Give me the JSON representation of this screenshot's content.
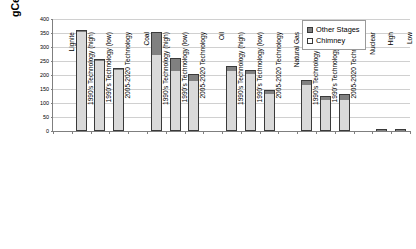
{
  "chart_data": {
    "type": "bar",
    "title": "",
    "subtitle": "",
    "xlabel": "",
    "ylabel": "gCeq/kWh",
    "ylim": [
      0,
      400
    ],
    "yticks": [
      0,
      50,
      100,
      150,
      200,
      250,
      300,
      350,
      400
    ],
    "grid": true,
    "stacked": true,
    "legend_position": "top-right",
    "legend": [
      "Other Stages",
      "Chimney"
    ],
    "categories": [
      "Lignite",
      "1990's Technology (high)",
      "1990's Technology (low)",
      "2005-2020 Technology",
      "Coal",
      "1990's Technology (high)",
      "1990's Technology (low)",
      "2005-2020 Technology",
      "Oil",
      "1990's Technology (high)",
      "1990's Technology (low)",
      "2005-2020 Technology",
      "Natural Gas",
      "1990's Technology (high)",
      "1990's Technology (low)",
      "2005-2020 Technology",
      "Nuclear",
      "High",
      "Low"
    ],
    "series": [
      {
        "name": "Chimney",
        "color": "#d9d9d9",
        "values": [
          null,
          352,
          251,
          219,
          null,
          273,
          213,
          178,
          null,
          215,
          205,
          133,
          null,
          163,
          110,
          112,
          null,
          0,
          0
        ]
      },
      {
        "name": "Other Stages",
        "color": "#808080",
        "values": [
          null,
          10,
          8,
          7,
          null,
          82,
          49,
          25,
          null,
          17,
          13,
          15,
          null,
          19,
          16,
          19,
          null,
          8,
          4
        ]
      }
    ],
    "totals": [
      null,
      362,
      259,
      226,
      null,
      355,
      262,
      203,
      null,
      232,
      218,
      148,
      null,
      182,
      126,
      131,
      null,
      8,
      4
    ]
  },
  "axis": {
    "y_title": "gCeq/kWh"
  },
  "legend": {
    "items": [
      {
        "label": "Other Stages",
        "swatch": "other"
      },
      {
        "label": "Chimney",
        "swatch": "chimney"
      }
    ]
  }
}
